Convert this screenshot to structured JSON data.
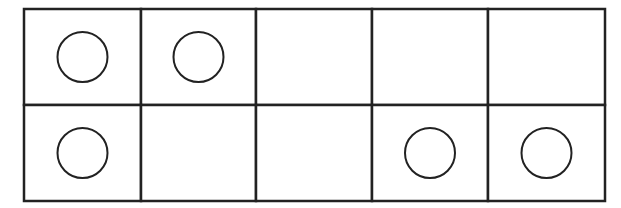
{
  "frame": {
    "rows": 2,
    "cols": 5,
    "stroke_color": "#222222",
    "cells": [
      [
        true,
        true,
        false,
        false,
        false
      ],
      [
        true,
        false,
        false,
        true,
        true
      ]
    ],
    "filled_count": 5
  }
}
